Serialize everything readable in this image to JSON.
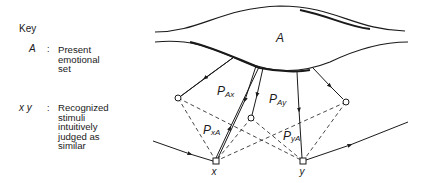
{
  "key": {
    "title": "Key",
    "entries": [
      {
        "symbol": "A",
        "separator": ":",
        "description_lines": [
          "Present",
          "emotional",
          "set"
        ]
      },
      {
        "symbol": "x y",
        "separator": ":",
        "description_lines": [
          "Recognized",
          "stimuli",
          "intuitively",
          "judged as",
          "similar"
        ]
      }
    ]
  },
  "diagram": {
    "region_label": "A",
    "path_labels": {
      "PAx": {
        "main": "P",
        "sub": "Ax"
      },
      "PAy": {
        "main": "P",
        "sub": "Ay"
      },
      "PxA": {
        "main": "P",
        "sub": "xA"
      },
      "PyA": {
        "main": "P",
        "sub": "yA"
      }
    },
    "node_labels": {
      "x": "x",
      "y": "y"
    },
    "colors": {
      "ink": "#1a1a1a",
      "background": "#ffffff"
    }
  }
}
